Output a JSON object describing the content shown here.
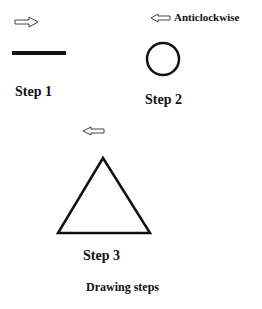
{
  "diagram": {
    "caption": "Drawing steps",
    "steps": [
      {
        "label": "Step 1",
        "shape": "line",
        "arrow": "right-arrow-icon"
      },
      {
        "label": "Step 2",
        "shape": "circle",
        "arrow": "left-arrow-icon",
        "direction_note": "Anticlockwise"
      },
      {
        "label": "Step 3",
        "shape": "triangle",
        "arrow": "left-arrow-icon"
      }
    ]
  }
}
